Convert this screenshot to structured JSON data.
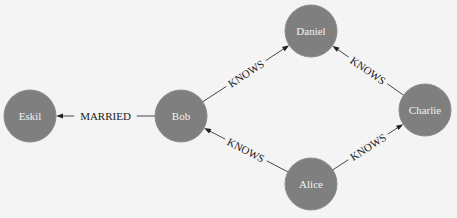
{
  "diagram": {
    "type": "graph",
    "style": {
      "background": "#f4f4f4",
      "node_fill": "#7f7f7f",
      "node_label_color": "#f2f2f2",
      "edge_color": "#333333"
    },
    "nodes": [
      {
        "id": "eskil",
        "label": "Eskil",
        "x": 30,
        "y": 116
      },
      {
        "id": "bob",
        "label": "Bob",
        "x": 181,
        "y": 116
      },
      {
        "id": "daniel",
        "label": "Daniel",
        "x": 311,
        "y": 31
      },
      {
        "id": "charlie",
        "label": "Charlie",
        "x": 425,
        "y": 110
      },
      {
        "id": "alice",
        "label": "Alice",
        "x": 311,
        "y": 184
      }
    ],
    "edges": [
      {
        "from": "bob",
        "to": "eskil",
        "label": "MARRIED"
      },
      {
        "from": "bob",
        "to": "daniel",
        "label": "KNOWS"
      },
      {
        "from": "charlie",
        "to": "daniel",
        "label": "KNOWS"
      },
      {
        "from": "alice",
        "to": "bob",
        "label": "KNOWS"
      },
      {
        "from": "alice",
        "to": "charlie",
        "label": "KNOWS"
      }
    ]
  }
}
